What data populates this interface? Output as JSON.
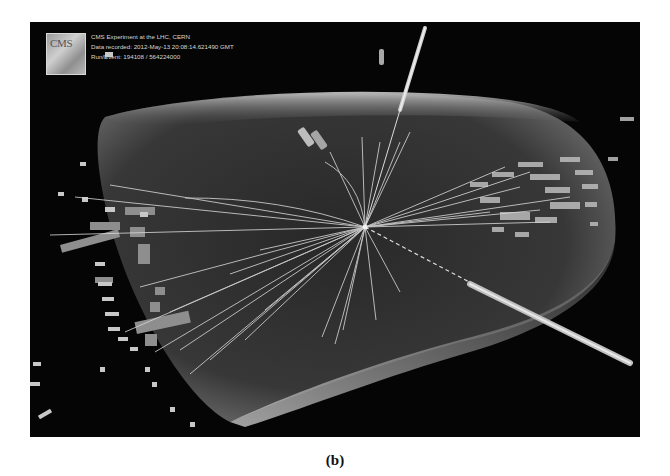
{
  "figure": {
    "logo_text": "CMS",
    "info_lines": [
      "CMS Experiment at the LHC, CERN",
      "Data recorded: 2012-May-13 20:08:14.621490 GMT",
      "Run/Event: 194108 / 564224000"
    ],
    "background_color": "#050505",
    "track_color": "#d9d9d9"
  },
  "caption": "(b)"
}
